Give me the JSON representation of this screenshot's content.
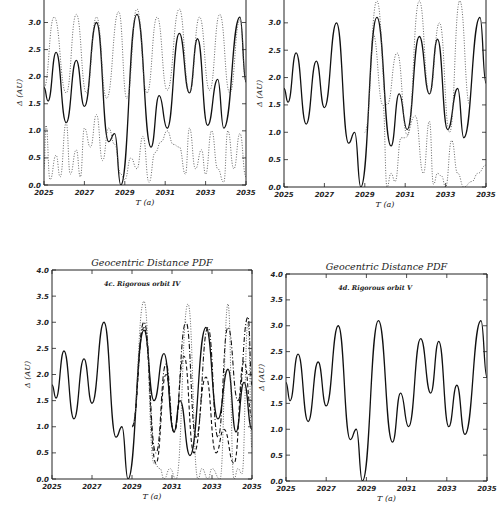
{
  "chart_data": [
    {
      "id": "4a",
      "type": "line",
      "title": "",
      "annotation": "",
      "xlabel": "T (a)",
      "ylabel": "Δ (AU)",
      "xlim": [
        2025,
        2035
      ],
      "ylim": [
        0.0,
        3.6
      ],
      "xticks": [
        "2025",
        "2027",
        "2029",
        "2031",
        "2033",
        "2035"
      ],
      "yticks": [
        "0.0",
        "0.5",
        "1.0",
        "1.5",
        "2.0",
        "2.5",
        "3.0",
        "3.5"
      ],
      "grid": false,
      "box": {
        "left": 44,
        "top": -10,
        "right": 246,
        "bottom": 185
      },
      "series": [
        {
          "name": "nominal",
          "style": "solid",
          "x": [
            2025,
            2025.2,
            2025.6,
            2026.1,
            2026.6,
            2027.0,
            2027.6,
            2028.2,
            2028.5,
            2028.8,
            2029.6,
            2030.3,
            2030.7,
            2031.1,
            2031.7,
            2032.2,
            2032.6,
            2033.1,
            2033.6,
            2033.9,
            2034.7,
            2035
          ],
          "y": [
            1.8,
            1.55,
            2.45,
            1.15,
            2.3,
            1.45,
            3.0,
            0.8,
            0.95,
            0.0,
            3.15,
            0.7,
            1.65,
            1.05,
            2.8,
            1.7,
            2.7,
            1.1,
            1.95,
            1.05,
            3.1,
            1.9
          ]
        },
        {
          "name": "upper envelope",
          "style": "dotted",
          "x": [
            2025,
            2025.5,
            2026.1,
            2026.6,
            2027.1,
            2027.6,
            2028.1,
            2028.7,
            2029.1,
            2029.6,
            2030.1,
            2030.6,
            2031.1,
            2031.7,
            2032.2,
            2032.7,
            2033.2,
            2033.7,
            2034.2,
            2034.7,
            2035
          ],
          "y": [
            1.8,
            3.1,
            1.7,
            3.15,
            1.7,
            3.1,
            1.6,
            3.2,
            1.6,
            3.25,
            1.7,
            3.1,
            1.75,
            3.25,
            1.7,
            3.1,
            1.75,
            3.15,
            1.7,
            3.05,
            1.9
          ]
        },
        {
          "name": "lower envelope",
          "style": "dotted",
          "x": [
            2025,
            2025.1,
            2025.3,
            2025.6,
            2025.8,
            2026.1,
            2026.3,
            2026.6,
            2026.8,
            2027.0,
            2027.3,
            2027.6,
            2027.9,
            2028.2,
            2028.5,
            2028.8,
            2029.0,
            2029.3,
            2029.6,
            2029.9,
            2030.2,
            2030.5,
            2030.8,
            2031.1,
            2031.4,
            2031.7,
            2032.0,
            2032.2,
            2032.5,
            2032.8,
            2033.0,
            2033.3,
            2033.6,
            2033.9,
            2034.1,
            2034.4,
            2034.7,
            2035
          ],
          "y": [
            0.3,
            1.1,
            0.1,
            0.55,
            0.15,
            1.15,
            0.2,
            0.65,
            0.15,
            1.05,
            0.7,
            1.3,
            0.45,
            1.05,
            0.75,
            0.2,
            0.1,
            0.5,
            0.3,
            0.9,
            0.05,
            0.6,
            0.8,
            1.0,
            0.75,
            0.7,
            0.2,
            1.05,
            0.3,
            0.65,
            0.2,
            1.0,
            0.3,
            0.05,
            1.0,
            0.3,
            0.95,
            0.15
          ]
        }
      ]
    },
    {
      "id": "4b",
      "type": "line",
      "title": "",
      "annotation": "",
      "xlabel": "T (a)",
      "ylabel": "Δ (AU)",
      "xlim": [
        2025,
        2035
      ],
      "ylim": [
        0.0,
        3.6
      ],
      "xticks": [
        "2025",
        "2027",
        "2029",
        "2031",
        "2033",
        "2035"
      ],
      "yticks": [
        "0.0",
        "0.5",
        "1.0",
        "1.5",
        "2.0",
        "2.5",
        "3.0",
        "3.5"
      ],
      "grid": false,
      "box": {
        "left": 284,
        "top": -10,
        "right": 486,
        "bottom": 187
      },
      "series": [
        {
          "name": "nominal",
          "style": "solid",
          "x": [
            2025,
            2025.2,
            2025.6,
            2026.1,
            2026.6,
            2027.0,
            2027.6,
            2028.2,
            2028.5,
            2028.8,
            2029.6,
            2030.3,
            2030.7,
            2031.1,
            2031.7,
            2032.2,
            2032.6,
            2033.1,
            2033.6,
            2033.9,
            2034.7,
            2035
          ],
          "y": [
            1.8,
            1.55,
            2.45,
            1.15,
            2.3,
            1.45,
            3.0,
            0.8,
            1.0,
            0.0,
            3.1,
            0.75,
            1.7,
            1.05,
            2.75,
            1.7,
            2.7,
            1.05,
            1.8,
            0.9,
            3.1,
            1.9
          ]
        },
        {
          "name": "upper envelope",
          "style": "dotted",
          "x": [
            2029.0,
            2029.6,
            2030.1,
            2030.6,
            2031.1,
            2031.7,
            2032.2,
            2032.7,
            2033.2,
            2033.7,
            2034.2
          ],
          "y": [
            1.0,
            3.4,
            1.5,
            2.45,
            0.95,
            3.4,
            1.7,
            3.0,
            1.0,
            3.4,
            1.5
          ]
        },
        {
          "name": "lower envelope",
          "style": "dotted",
          "x": [
            2029.4,
            2029.9,
            2030.1,
            2030.3,
            2030.5,
            2030.8,
            2031.0,
            2031.5,
            2031.9,
            2032.2,
            2032.4,
            2032.6,
            2032.8,
            2033.0,
            2033.3,
            2033.6,
            2033.9,
            2034.3,
            2034.6,
            2035
          ],
          "y": [
            2.8,
            1.5,
            0.0,
            0.25,
            0.1,
            0.9,
            0.9,
            1.3,
            0.25,
            1.2,
            0.05,
            0.25,
            0.2,
            0.0,
            0.85,
            0.25,
            0.0,
            0.1,
            0.25,
            0.4
          ]
        }
      ]
    },
    {
      "id": "4c",
      "type": "line",
      "title": "Geocentric Distance PDF",
      "annotation": "4c. Rigorous orbit IV",
      "xlabel": "T (a)",
      "ylabel": "Δ (AU)",
      "xlim": [
        2025,
        2035
      ],
      "ylim": [
        0.0,
        4.0
      ],
      "xticks": [
        "2025",
        "2027",
        "2029",
        "2031",
        "2033",
        "2035"
      ],
      "yticks": [
        "0.0",
        "0.5",
        "1.0",
        "1.5",
        "2.0",
        "2.5",
        "3.0",
        "3.5",
        "4.0"
      ],
      "grid": false,
      "box": {
        "left": 52,
        "top": 270,
        "right": 252,
        "bottom": 479
      },
      "series": [
        {
          "name": "nominal",
          "style": "solid",
          "x": [
            2025,
            2025.2,
            2025.6,
            2026.1,
            2026.6,
            2027.0,
            2027.6,
            2028.2,
            2028.5,
            2028.8,
            2029.6,
            2030.1,
            2030.6,
            2031.1,
            2031.4,
            2031.9,
            2032.7,
            2033.3,
            2033.8,
            2034.2,
            2034.6,
            2035
          ],
          "y": [
            1.8,
            1.55,
            2.45,
            1.15,
            2.3,
            1.45,
            3.0,
            0.8,
            1.0,
            0.0,
            2.85,
            1.5,
            2.4,
            0.9,
            1.5,
            0.45,
            2.9,
            1.15,
            2.1,
            0.9,
            1.85,
            0.95
          ]
        },
        {
          "name": "dash-dot",
          "style": "dashdot",
          "x": [
            2029.0,
            2029.6,
            2030.2,
            2030.7,
            2031.1,
            2031.7,
            2032.2,
            2032.8,
            2033.3,
            2033.8,
            2034.3,
            2034.8,
            2035
          ],
          "y": [
            1.0,
            3.0,
            0.5,
            2.2,
            0.9,
            3.0,
            0.8,
            2.9,
            0.8,
            2.9,
            1.5,
            3.1,
            1.8
          ]
        },
        {
          "name": "dashed",
          "style": "dashed",
          "x": [
            2029.0,
            2029.6,
            2030.2,
            2030.7,
            2031.1,
            2031.6,
            2032.1,
            2032.7,
            2033.2,
            2033.6,
            2034.1,
            2034.6,
            2035
          ],
          "y": [
            1.0,
            2.9,
            0.3,
            2.0,
            0.9,
            2.35,
            0.5,
            1.95,
            0.5,
            0.95,
            0.3,
            2.25,
            1.2
          ]
        },
        {
          "name": "dotted envelope",
          "style": "dotted",
          "x": [
            2029.0,
            2029.6,
            2030.1,
            2030.4,
            2030.6,
            2030.9,
            2031.2,
            2031.8,
            2032.3,
            2032.5,
            2032.8,
            2033.0,
            2033.4,
            2033.8,
            2034.1,
            2034.3,
            2034.5,
            2034.8,
            2035
          ],
          "y": [
            1.0,
            3.4,
            0.3,
            0.2,
            0.0,
            0.2,
            0.0,
            3.35,
            0.0,
            0.2,
            0.0,
            0.2,
            0.0,
            3.35,
            0.0,
            0.2,
            0.1,
            3.0,
            0.6
          ]
        }
      ]
    },
    {
      "id": "4d",
      "type": "line",
      "title": "Geocentric Distance PDF",
      "annotation": "4d. Rigorous orbit V",
      "xlabel": "T (a)",
      "ylabel": "Δ (AU)",
      "xlim": [
        2025,
        2035
      ],
      "ylim": [
        0.0,
        4.0
      ],
      "xticks": [
        "2025",
        "2027",
        "2029",
        "2031",
        "2033",
        "2035"
      ],
      "yticks": [
        "0.0",
        "0.5",
        "1.0",
        "1.5",
        "2.0",
        "2.5",
        "3.0",
        "3.5",
        "4.0"
      ],
      "grid": false,
      "box": {
        "left": 286,
        "top": 274,
        "right": 487,
        "bottom": 481
      },
      "series": [
        {
          "name": "nominal",
          "style": "solid",
          "x": [
            2025,
            2025.2,
            2025.6,
            2026.1,
            2026.6,
            2027.0,
            2027.6,
            2028.2,
            2028.5,
            2028.8,
            2029.6,
            2030.3,
            2030.7,
            2031.1,
            2031.7,
            2032.2,
            2032.6,
            2033.1,
            2033.5,
            2033.9,
            2034.7,
            2035
          ],
          "y": [
            1.9,
            1.55,
            2.45,
            1.15,
            2.3,
            1.45,
            3.0,
            0.8,
            1.0,
            0.0,
            3.1,
            0.75,
            1.7,
            1.05,
            2.75,
            1.7,
            2.7,
            1.05,
            1.85,
            0.9,
            3.1,
            2.0
          ]
        }
      ]
    }
  ]
}
